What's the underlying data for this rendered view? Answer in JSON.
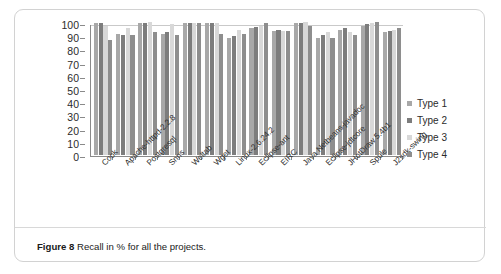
{
  "caption": {
    "prefix": "Figure 8",
    "text": " Recall in % for all the projects."
  },
  "legend": {
    "position": "right",
    "items": [
      {
        "label": "Type 1",
        "color": "#a8a8a8"
      },
      {
        "label": "Type 2",
        "color": "#7d7d7d"
      },
      {
        "label": "Type 3",
        "color": "#d8d8d8"
      },
      {
        "label": "Type 4",
        "color": "#8e8e8e"
      }
    ]
  },
  "chart_data": {
    "type": "bar",
    "title": "",
    "xlabel": "",
    "ylabel": "",
    "ylim": [
      0,
      100
    ],
    "yticks": [
      0,
      10,
      20,
      30,
      40,
      50,
      60,
      70,
      80,
      90,
      100
    ],
    "grid": false,
    "legend_position": "right",
    "categories": [
      "Cook",
      "Apache-httpd-2.2.8",
      "Postgresql",
      "Snns",
      "Weltab",
      "Wget",
      "Linux-2.6.24.2",
      "Eclipse-ant",
      "EIRC",
      "Java Netbeans-javadoc",
      "Eclipse-jdtcore",
      "JHotDraw 5.4b1",
      "Spule",
      "J2sdk-swing"
    ],
    "series": [
      {
        "name": "Type 1",
        "color": "#a8a8a8",
        "values": [
          100,
          92,
          100,
          92,
          100,
          100,
          89,
          96,
          94,
          100,
          89,
          95,
          98,
          93
        ]
      },
      {
        "name": "Type 2",
        "color": "#7d7d7d",
        "values": [
          100,
          91,
          100,
          93,
          100,
          100,
          90,
          97,
          95,
          100,
          91,
          96,
          99,
          94
        ]
      },
      {
        "name": "Type 3",
        "color": "#d8d8d8",
        "values": [
          98,
          96,
          101,
          99,
          100,
          100,
          95,
          98,
          94,
          101,
          93,
          93,
          100,
          95
        ]
      },
      {
        "name": "Type 4",
        "color": "#8e8e8e",
        "values": [
          87,
          91,
          93,
          91,
          100,
          92,
          92,
          100,
          94,
          98,
          89,
          91,
          101,
          96
        ]
      }
    ]
  }
}
